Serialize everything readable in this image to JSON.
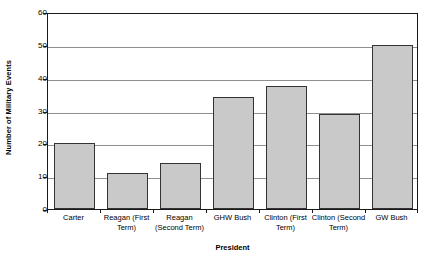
{
  "chart_data": {
    "type": "bar",
    "title": "",
    "subtitle": "",
    "xlabel": "President",
    "ylabel": "Number of Military Events",
    "categories": [
      "Carter",
      "Reagan (First Term)",
      "Reagan (Second Term)",
      "GHW Bush",
      "Clinton (First Term)",
      "Clinton (Second Term)",
      "GW Bush"
    ],
    "values": [
      20,
      11,
      14,
      34,
      37.5,
      29,
      50
    ],
    "ylim": [
      0,
      60
    ],
    "yticks": [
      0,
      10,
      20,
      30,
      40,
      50,
      60
    ],
    "ytick_labels": [
      "0",
      "10",
      "20",
      "30",
      "40",
      "50",
      "60"
    ],
    "grid": true,
    "grid_axis": "y",
    "legend": false,
    "legend_position": "none",
    "bar_fill_color": "#c9c9c9",
    "bar_edge_color": "#333333",
    "gridline_color": "#909090",
    "frame_color": "#1a1a1a",
    "background_color": "#ffffff"
  },
  "x_axis_label_lines": [
    [
      "Carter"
    ],
    [
      "Reagan (First",
      "Term)"
    ],
    [
      "Reagan",
      "(Second Term)"
    ],
    [
      "GHW Bush"
    ],
    [
      "Clinton (First",
      "Term)"
    ],
    [
      "Clinton (Second",
      "Term)"
    ],
    [
      "GW Bush"
    ]
  ]
}
